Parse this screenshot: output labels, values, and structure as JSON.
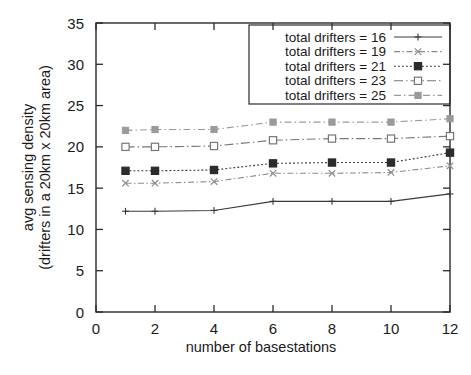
{
  "chart_data": {
    "type": "line",
    "title": "",
    "xlabel": "number of basestations",
    "ylabel": "avg sensing density\n(drifters in a 20km x 20km area)",
    "ylabel_line1": "avg sensing density",
    "ylabel_line2": "(drifters in a 20km x 20km area)",
    "x": [
      1,
      2,
      4,
      6,
      8,
      10,
      12
    ],
    "xlim": [
      0,
      12
    ],
    "ylim": [
      0,
      35
    ],
    "xticks": [
      0,
      2,
      4,
      6,
      8,
      10,
      12
    ],
    "yticks": [
      0,
      5,
      10,
      15,
      20,
      25,
      30,
      35
    ],
    "xtick_labels": [
      "0",
      "2",
      "4",
      "6",
      "8",
      "10",
      "12"
    ],
    "ytick_labels": [
      "0",
      "5",
      "10",
      "15",
      "20",
      "25",
      "30",
      "35"
    ],
    "grid": false,
    "legend_position": "top-right",
    "series": [
      {
        "name": "total drifters = 16",
        "values": [
          12.2,
          12.2,
          12.3,
          13.4,
          13.4,
          13.4,
          14.3
        ],
        "marker": "plus",
        "dash": "none",
        "color": "#3a3a3a"
      },
      {
        "name": "total drifters = 19",
        "values": [
          15.6,
          15.6,
          15.8,
          16.8,
          16.8,
          16.9,
          17.7
        ],
        "marker": "cross",
        "dash": "dash-dot",
        "color": "#8c8c8c"
      },
      {
        "name": "total drifters = 21",
        "values": [
          17.1,
          17.1,
          17.2,
          18.0,
          18.1,
          18.1,
          19.3
        ],
        "marker": "filled-square",
        "dash": "dotted",
        "color": "#2b2b2b"
      },
      {
        "name": "total drifters = 23",
        "values": [
          20.0,
          20.0,
          20.1,
          20.8,
          21.0,
          21.0,
          21.3
        ],
        "marker": "open-square",
        "dash": "dash-dot-long",
        "color": "#777777"
      },
      {
        "name": "total drifters = 25",
        "values": [
          22.0,
          22.1,
          22.1,
          23.0,
          23.0,
          23.0,
          23.4
        ],
        "marker": "filled-square-gray",
        "dash": "dash-dot-gray",
        "color": "#9a9a9a"
      }
    ]
  },
  "legend": {
    "entries": [
      {
        "label": "total drifters = 16"
      },
      {
        "label": "total drifters = 19"
      },
      {
        "label": "total drifters = 21"
      },
      {
        "label": "total drifters = 23"
      },
      {
        "label": "total drifters = 25"
      }
    ]
  },
  "axes": {
    "x_title": "number of basestations",
    "y_title_line1": "avg sensing density",
    "y_title_line2": "(drifters in a 20km x 20km area)"
  }
}
